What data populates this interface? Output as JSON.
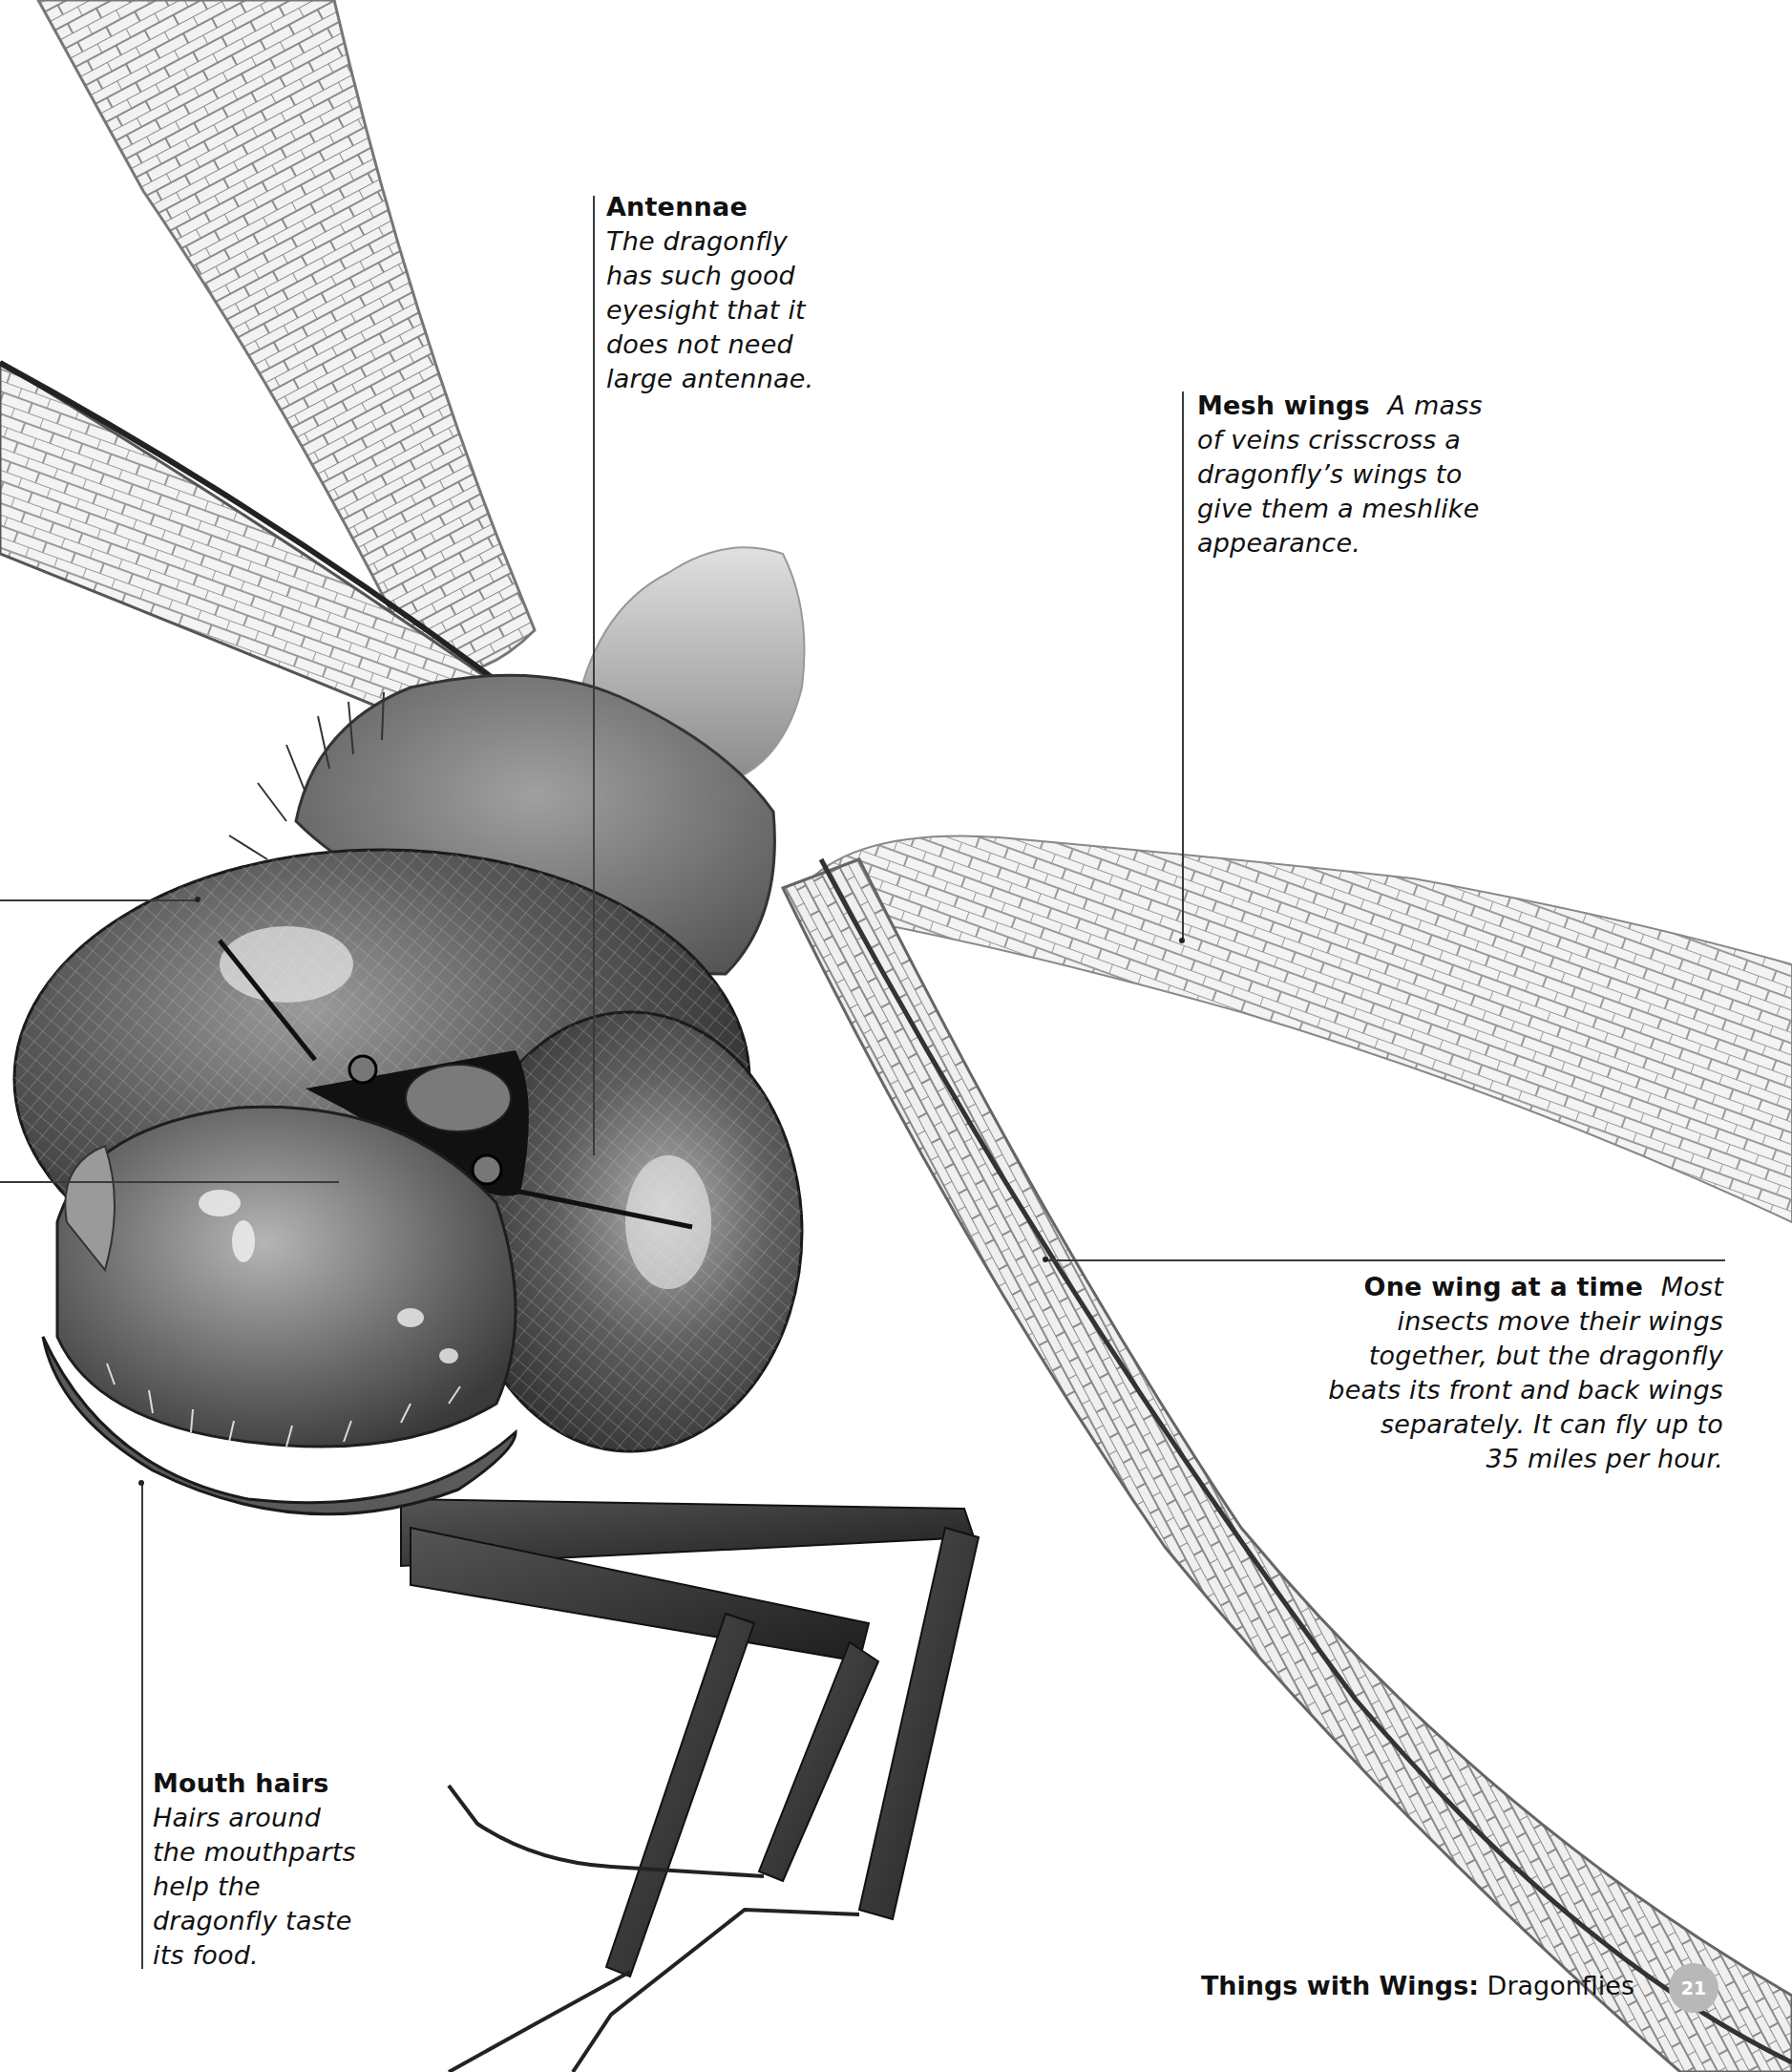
{
  "callouts": {
    "antennae": {
      "title": "Antennae",
      "lines": [
        "The dragonfly",
        "has such good",
        "eyesight that it",
        "does not need",
        "large antennae."
      ]
    },
    "mesh_wings": {
      "title": "Mesh wings",
      "first_line_rest": "A mass",
      "lines": [
        "of veins crisscross a",
        "dragonfly’s wings to",
        "give them a meshlike",
        "appearance."
      ]
    },
    "one_wing": {
      "title": "One wing at a time",
      "first_line_rest": "Most",
      "lines": [
        "insects move their wings",
        "together, but the dragonfly",
        "beats its front and back wings",
        "separately. It can fly up to",
        "35 miles per hour."
      ]
    },
    "mouth_hairs": {
      "title": "Mouth hairs",
      "lines": [
        "Hairs around",
        "the mouthparts",
        "help the",
        "dragonfly taste",
        "its food."
      ]
    }
  },
  "footer": {
    "series": "Things with Wings:",
    "topic": "Dragonflies",
    "page_number": "21"
  },
  "illustration": {
    "subject": "dragonfly-head-closeup",
    "palette": {
      "ink": "#1a1a1a",
      "body_dark": "#3c3c3c",
      "body_mid": "#6e6e6e",
      "wing_vein": "#7a7a7a",
      "wing_fill": "#eeeeee",
      "badge": "#b8b8b8"
    }
  }
}
